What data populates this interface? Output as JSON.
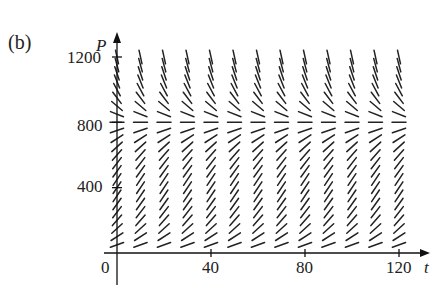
{
  "panel_label": "(b)",
  "chart_data": {
    "type": "direction_field",
    "title": "",
    "panel": "(b)",
    "xlabel": "t",
    "ylabel": "P",
    "xlim": [
      0,
      128
    ],
    "ylim": [
      0,
      1250
    ],
    "x_ticks": [
      0,
      40,
      80,
      120
    ],
    "x_tick_labels": [
      "0",
      "40",
      "80",
      "120"
    ],
    "y_ticks": [
      400,
      800,
      1200
    ],
    "y_tick_labels": [
      "400",
      "800",
      "1200"
    ],
    "grid": false,
    "legend": null,
    "field": {
      "description": "Autonomous slope field dP/dt depending only on P: slopes positive for 0 < P < ~800, zero near P ≈ 800 (equilibrium), negative for P > ~800; steepest near P ≈ 0 and P ≈ 1200",
      "equilibrium_P": 800,
      "t_columns": [
        0,
        10,
        20,
        30,
        40,
        50,
        60,
        70,
        80,
        90,
        100,
        110,
        120
      ],
      "P_rows": [
        0,
        50,
        100,
        150,
        200,
        250,
        300,
        350,
        400,
        450,
        500,
        550,
        600,
        650,
        700,
        750,
        800,
        850,
        900,
        950,
        1000,
        1050,
        1100,
        1150,
        1200
      ],
      "slope_sign_by_row": {
        "below_800": "positive",
        "at_800": "zero",
        "above_800": "negative"
      }
    }
  },
  "labels": {
    "x_axis": "t",
    "y_axis": "P",
    "x_tick_0": "0",
    "x_tick_40": "40",
    "x_tick_80": "80",
    "x_tick_120": "120",
    "y_tick_400": "400",
    "y_tick_800": "800",
    "y_tick_1200": "1200"
  }
}
